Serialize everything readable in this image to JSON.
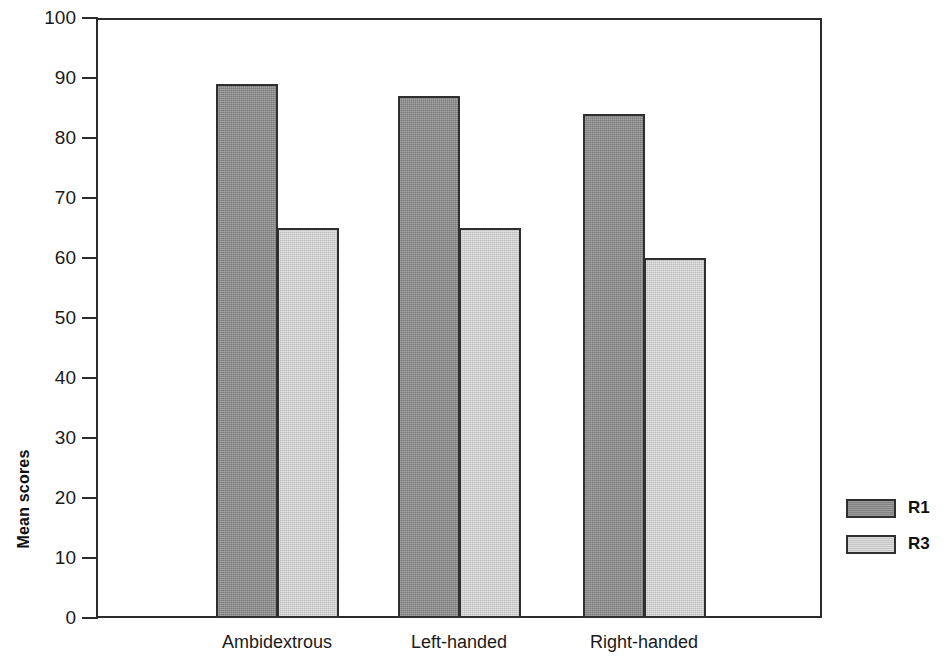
{
  "chart_data": {
    "type": "bar",
    "title": "",
    "xlabel": "",
    "ylabel": "Mean scores",
    "categories": [
      "Ambidextrous",
      "Left-handed",
      "Right-handed"
    ],
    "series": [
      {
        "name": "R1",
        "values": [
          89,
          87,
          84
        ],
        "color": "#8d8d8d"
      },
      {
        "name": "R3",
        "values": [
          65,
          65,
          60
        ],
        "color": "#d2d2d2"
      }
    ],
    "ylim": [
      0,
      100
    ],
    "ytick_labels": [
      "0",
      "10",
      "20",
      "30",
      "40",
      "50",
      "60",
      "70",
      "80",
      "90",
      "100"
    ],
    "ytick_values": [
      0,
      10,
      20,
      30,
      40,
      50,
      60,
      70,
      80,
      90,
      100
    ],
    "grid": false,
    "legend_position": "right",
    "legend_entries": [
      "R1",
      "R3"
    ],
    "bar_border_color": "#2f2f2f",
    "axis_color": "#2b2b2b",
    "background_color": "#ffffff"
  }
}
